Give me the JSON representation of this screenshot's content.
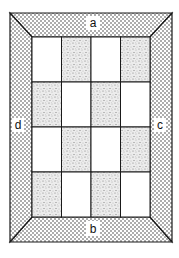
{
  "labels": {
    "top": "a",
    "bottom": "b",
    "right": "c",
    "left": "d"
  },
  "grid": {
    "rows": 4,
    "cols": 4,
    "pattern": [
      [
        "white",
        "shaded",
        "white",
        "shaded"
      ],
      [
        "shaded",
        "white",
        "shaded",
        "white"
      ],
      [
        "white",
        "shaded",
        "white",
        "shaded"
      ],
      [
        "shaded",
        "white",
        "shaded",
        "white"
      ]
    ]
  },
  "colors": {
    "line": "#1a1a1a",
    "background": "#ffffff",
    "dot": "#333333"
  }
}
